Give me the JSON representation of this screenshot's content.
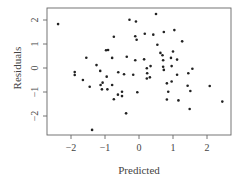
{
  "chart_data": {
    "type": "scatter",
    "title": "",
    "xlabel": "Predicted",
    "ylabel": "Residuals",
    "xlim": [
      -2.5,
      2.6
    ],
    "ylim": [
      -2.75,
      2.5
    ],
    "xticks": [
      -2,
      -1,
      0,
      1,
      2
    ],
    "yticks": [
      -2,
      -1,
      0,
      1,
      2
    ],
    "xtick_labels": [
      "−2",
      "−1",
      "0",
      "1",
      "2"
    ],
    "ytick_labels": [
      "−2",
      "−1",
      "0",
      "1",
      "2"
    ],
    "grid": false,
    "legend": null,
    "point_color": "#222222",
    "points": [
      {
        "x": -2.38,
        "y": 1.83
      },
      {
        "x": -1.89,
        "y": -0.17
      },
      {
        "x": -1.89,
        "y": -0.29
      },
      {
        "x": -1.65,
        "y": -0.5
      },
      {
        "x": -1.55,
        "y": 0.43
      },
      {
        "x": -1.45,
        "y": -0.78
      },
      {
        "x": -1.38,
        "y": -2.58
      },
      {
        "x": -1.25,
        "y": 0.12
      },
      {
        "x": -1.14,
        "y": -0.12
      },
      {
        "x": -1.13,
        "y": -0.71
      },
      {
        "x": -1.09,
        "y": -0.89
      },
      {
        "x": -1.07,
        "y": -0.61
      },
      {
        "x": -0.97,
        "y": 0.74
      },
      {
        "x": -0.95,
        "y": -0.36
      },
      {
        "x": -0.93,
        "y": -0.89
      },
      {
        "x": -0.91,
        "y": 0.75
      },
      {
        "x": -0.79,
        "y": 0.42
      },
      {
        "x": -0.79,
        "y": -0.71
      },
      {
        "x": -0.74,
        "y": 1.3
      },
      {
        "x": -0.74,
        "y": -1.3
      },
      {
        "x": -0.62,
        "y": -1.11
      },
      {
        "x": -0.61,
        "y": -0.18
      },
      {
        "x": -0.5,
        "y": -0.99
      },
      {
        "x": -0.5,
        "y": -1.17
      },
      {
        "x": -0.44,
        "y": -0.26
      },
      {
        "x": -0.38,
        "y": -1.89
      },
      {
        "x": -0.36,
        "y": 0.47
      },
      {
        "x": -0.28,
        "y": 2.01
      },
      {
        "x": -0.17,
        "y": -0.28
      },
      {
        "x": -0.11,
        "y": 1.32
      },
      {
        "x": -0.11,
        "y": 0.32
      },
      {
        "x": -0.09,
        "y": 1.94
      },
      {
        "x": -0.07,
        "y": 1.18
      },
      {
        "x": -0.05,
        "y": -1.01
      },
      {
        "x": 0.15,
        "y": 0.36
      },
      {
        "x": 0.17,
        "y": 1.43
      },
      {
        "x": 0.23,
        "y": -0.01
      },
      {
        "x": 0.23,
        "y": -0.44
      },
      {
        "x": 0.24,
        "y": -0.22
      },
      {
        "x": 0.32,
        "y": -0.39
      },
      {
        "x": 0.34,
        "y": 0.08
      },
      {
        "x": 0.42,
        "y": 1.39
      },
      {
        "x": 0.5,
        "y": 2.25
      },
      {
        "x": 0.54,
        "y": 0.97
      },
      {
        "x": 0.63,
        "y": 0.63
      },
      {
        "x": 0.69,
        "y": 0.53
      },
      {
        "x": 0.71,
        "y": 0.32
      },
      {
        "x": 0.71,
        "y": 0.05
      },
      {
        "x": 0.73,
        "y": 1.5
      },
      {
        "x": 0.73,
        "y": -0.08
      },
      {
        "x": 0.82,
        "y": -0.64
      },
      {
        "x": 0.82,
        "y": -1.31
      },
      {
        "x": 0.86,
        "y": -0.99
      },
      {
        "x": 0.94,
        "y": 0.42
      },
      {
        "x": 0.96,
        "y": 0.08
      },
      {
        "x": 0.96,
        "y": -0.56
      },
      {
        "x": 1.0,
        "y": 0.69
      },
      {
        "x": 1.04,
        "y": 1.58
      },
      {
        "x": 1.12,
        "y": 0.35
      },
      {
        "x": 1.12,
        "y": -0.28
      },
      {
        "x": 1.16,
        "y": -1.35
      },
      {
        "x": 1.27,
        "y": 1.11
      },
      {
        "x": 1.43,
        "y": -0.74
      },
      {
        "x": 1.45,
        "y": -0.22
      },
      {
        "x": 1.49,
        "y": -1.71
      },
      {
        "x": 1.51,
        "y": -0.96
      },
      {
        "x": 1.57,
        "y": -0.03
      },
      {
        "x": 2.08,
        "y": -0.75
      },
      {
        "x": 2.45,
        "y": -1.4
      }
    ]
  }
}
